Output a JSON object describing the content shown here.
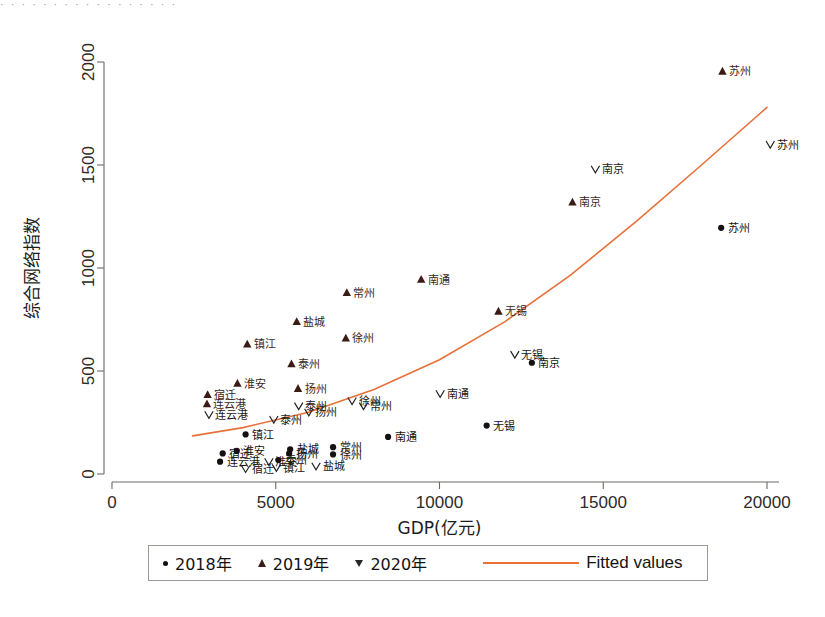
{
  "top_sliver_text": "· · · · · · · · · · · · · · · · ·",
  "chart_data": {
    "type": "scatter",
    "title": "",
    "xlabel": "GDP(亿元)",
    "ylabel": "综合网络指数",
    "xlim": [
      0,
      20600
    ],
    "ylim": [
      -120,
      2150
    ],
    "xticks": [
      0,
      5000,
      10000,
      15000,
      20000
    ],
    "xticklabels": [
      "0",
      "5000",
      "10000",
      "15000",
      "20000"
    ],
    "yticks": [
      0,
      500,
      1000,
      1500,
      2000
    ],
    "yticklabels": [
      "0",
      "500",
      "1000",
      "1500",
      "2000"
    ],
    "grid": false,
    "legend_position": "bottom-center",
    "legend": [
      {
        "label": "2018年",
        "marker": "circle",
        "color": "#151110"
      },
      {
        "label": "2019年",
        "marker": "triangle-up",
        "color": "#3a1c14"
      },
      {
        "label": "2020年",
        "marker": "triangle-down",
        "color": "#2a2522"
      },
      {
        "label": "Fitted values",
        "marker": "line",
        "color": "#e8713a"
      }
    ],
    "series": [
      {
        "name": "2018年",
        "marker": "circle",
        "color": "#151110",
        "points": [
          {
            "label": "苏州",
            "x": 18600,
            "y": 1195
          },
          {
            "label": "南京",
            "x": 12820,
            "y": 540
          },
          {
            "label": "无锡",
            "x": 11440,
            "y": 235
          },
          {
            "label": "南通",
            "x": 8430,
            "y": 180
          },
          {
            "label": "常州",
            "x": 6750,
            "y": 130
          },
          {
            "label": "徐州",
            "x": 6750,
            "y": 95
          },
          {
            "label": "盐城",
            "x": 5440,
            "y": 120
          },
          {
            "label": "扬州",
            "x": 5410,
            "y": 100
          },
          {
            "label": "泰州",
            "x": 5080,
            "y": 68
          },
          {
            "label": "淮安",
            "x": 3810,
            "y": 112
          },
          {
            "label": "宿迁",
            "x": 3380,
            "y": 100
          },
          {
            "label": "连云港",
            "x": 3300,
            "y": 60
          },
          {
            "label": "镇江",
            "x": 4080,
            "y": 192
          }
        ]
      },
      {
        "name": "2019年",
        "marker": "triangle-up",
        "color": "#3a1c14",
        "points": [
          {
            "label": "苏州",
            "x": 18640,
            "y": 1955
          },
          {
            "label": "南京",
            "x": 14060,
            "y": 1320
          },
          {
            "label": "无锡",
            "x": 11800,
            "y": 790
          },
          {
            "label": "南通",
            "x": 9440,
            "y": 945
          },
          {
            "label": "常州",
            "x": 7170,
            "y": 880
          },
          {
            "label": "徐州",
            "x": 7140,
            "y": 660
          },
          {
            "label": "盐城",
            "x": 5640,
            "y": 740
          },
          {
            "label": "镇江",
            "x": 4130,
            "y": 630
          },
          {
            "label": "泰州",
            "x": 5480,
            "y": 535
          },
          {
            "label": "扬州",
            "x": 5680,
            "y": 415
          },
          {
            "label": "淮安",
            "x": 3830,
            "y": 440
          },
          {
            "label": "宿迁",
            "x": 2920,
            "y": 385
          },
          {
            "label": "连云港",
            "x": 2900,
            "y": 340
          }
        ]
      },
      {
        "name": "2020年",
        "marker": "triangle-down",
        "color": "#2a2522",
        "points": [
          {
            "label": "苏州",
            "x": 20100,
            "y": 1600
          },
          {
            "label": "南京",
            "x": 14760,
            "y": 1480
          },
          {
            "label": "无锡",
            "x": 12300,
            "y": 580
          },
          {
            "label": "南通",
            "x": 10020,
            "y": 390
          },
          {
            "label": "常州",
            "x": 7680,
            "y": 330
          },
          {
            "label": "徐州",
            "x": 7330,
            "y": 355
          },
          {
            "label": "扬州",
            "x": 6010,
            "y": 300
          },
          {
            "label": "泰州",
            "x": 5700,
            "y": 330
          },
          {
            "label": "盐城",
            "x": 6230,
            "y": 38
          },
          {
            "label": "泰州",
            "x": 4940,
            "y": 265
          },
          {
            "label": "淮安",
            "x": 4790,
            "y": 60
          },
          {
            "label": "连云港",
            "x": 2960,
            "y": 288
          },
          {
            "label": "镇江",
            "x": 5020,
            "y": 30
          },
          {
            "label": "宿迁",
            "x": 4080,
            "y": 25
          }
        ]
      }
    ],
    "fitted_curve": {
      "name": "Fitted values",
      "color": "#e8713a",
      "points": [
        {
          "x": 2460,
          "y": 185
        },
        {
          "x": 4000,
          "y": 225
        },
        {
          "x": 6000,
          "y": 300
        },
        {
          "x": 8000,
          "y": 410
        },
        {
          "x": 10000,
          "y": 555
        },
        {
          "x": 12000,
          "y": 740
        },
        {
          "x": 14000,
          "y": 965
        },
        {
          "x": 16000,
          "y": 1225
        },
        {
          "x": 18000,
          "y": 1500
        },
        {
          "x": 20000,
          "y": 1780
        }
      ]
    }
  }
}
